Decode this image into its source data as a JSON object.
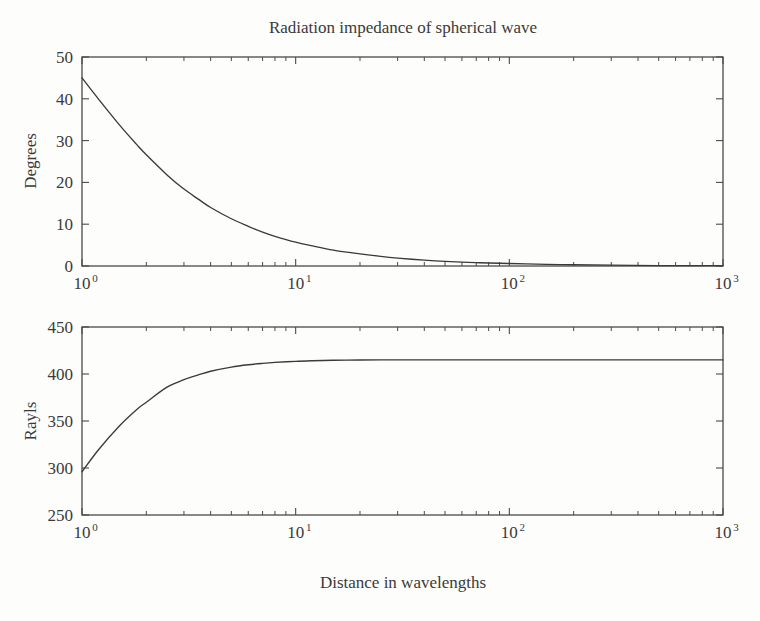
{
  "figure": {
    "title": "Radiation impedance of spherical wave",
    "xlabel": "Distance in wavelengths",
    "background_color": "#fdfdfb",
    "line_color": "#3a3a3a",
    "axis_color": "#4a4a4a"
  },
  "chart_data": [
    {
      "type": "line",
      "panel": "top",
      "title": "Radiation impedance of spherical wave",
      "xlabel": "",
      "ylabel": "Degrees",
      "xscale": "log",
      "yscale": "linear",
      "xlim": [
        1,
        1000
      ],
      "ylim": [
        0,
        50
      ],
      "grid": false,
      "legend": null,
      "xticks": [
        1,
        10,
        100,
        1000
      ],
      "xticklabels": [
        "10^0",
        "10^1",
        "10^2",
        "10^3"
      ],
      "yticks": [
        0,
        10,
        20,
        30,
        40,
        50
      ],
      "yticklabels": [
        "0",
        "10",
        "20",
        "30",
        "40",
        "50"
      ],
      "minor_xticks_per_decade": [
        2,
        3,
        4,
        5,
        6,
        7,
        8,
        9
      ],
      "series": [
        {
          "name": "Phase angle",
          "x": [
            1.0,
            1.2,
            1.5,
            1.8,
            2.0,
            2.5,
            3.0,
            3.5,
            4.0,
            5.0,
            6.0,
            7.0,
            8.0,
            10.0,
            12.0,
            15.0,
            20.0,
            25.0,
            30.0,
            40.0,
            50.0,
            70.0,
            100.0,
            150.0,
            200.0,
            300.0,
            500.0,
            700.0,
            1000.0
          ],
          "y": [
            45.0,
            39.8,
            33.7,
            29.1,
            26.6,
            21.8,
            18.4,
            16.0,
            14.0,
            11.3,
            9.5,
            8.1,
            7.1,
            5.7,
            4.8,
            3.8,
            2.9,
            2.3,
            1.9,
            1.4,
            1.1,
            0.8,
            0.6,
            0.4,
            0.3,
            0.2,
            0.1,
            0.1,
            0.1
          ]
        }
      ]
    },
    {
      "type": "line",
      "panel": "bottom",
      "title": "",
      "xlabel": "Distance in wavelengths",
      "ylabel": "Rayls",
      "xscale": "log",
      "yscale": "linear",
      "xlim": [
        1,
        1000
      ],
      "ylim": [
        250,
        450
      ],
      "grid": false,
      "legend": null,
      "xticks": [
        1,
        10,
        100,
        1000
      ],
      "xticklabels": [
        "10^0",
        "10^1",
        "10^2",
        "10^3"
      ],
      "yticks": [
        250,
        300,
        350,
        400,
        450
      ],
      "yticklabels": [
        "250",
        "300",
        "350",
        "400",
        "450"
      ],
      "minor_xticks_per_decade": [
        2,
        3,
        4,
        5,
        6,
        7,
        8,
        9
      ],
      "asymptote_value": 415,
      "series": [
        {
          "name": "Resistance",
          "x": [
            1.0,
            1.2,
            1.5,
            1.8,
            2.0,
            2.5,
            3.0,
            3.5,
            4.0,
            5.0,
            6.0,
            7.0,
            8.0,
            10.0,
            12.0,
            15.0,
            20.0,
            25.0,
            30.0,
            40.0,
            50.0,
            70.0,
            100.0,
            150.0,
            200.0,
            300.0,
            500.0,
            700.0,
            1000.0
          ],
          "y": [
            296.0,
            320.0,
            345.0,
            362.0,
            370.0,
            386.0,
            394.0,
            399.0,
            402.9,
            407.3,
            409.8,
            411.3,
            412.3,
            413.5,
            414.1,
            414.6,
            414.9,
            415.0,
            415.0,
            415.0,
            415.0,
            415.0,
            415.0,
            415.0,
            415.0,
            415.0,
            415.0,
            415.0,
            415.0
          ]
        }
      ]
    }
  ],
  "panels": {
    "top": {
      "ylabel": "Degrees",
      "yticklabels": [
        "50",
        "40",
        "30",
        "20",
        "10",
        "0"
      ],
      "xticklabels": [
        {
          "mantissa": "10",
          "exponent": "0"
        },
        {
          "mantissa": "10",
          "exponent": "1"
        },
        {
          "mantissa": "10",
          "exponent": "2"
        },
        {
          "mantissa": "10",
          "exponent": "3"
        }
      ]
    },
    "bottom": {
      "ylabel": "Rayls",
      "yticklabels": [
        "450",
        "400",
        "350",
        "300",
        "250"
      ],
      "xticklabels": [
        {
          "mantissa": "10",
          "exponent": "0"
        },
        {
          "mantissa": "10",
          "exponent": "1"
        },
        {
          "mantissa": "10",
          "exponent": "2"
        },
        {
          "mantissa": "10",
          "exponent": "3"
        }
      ]
    }
  }
}
